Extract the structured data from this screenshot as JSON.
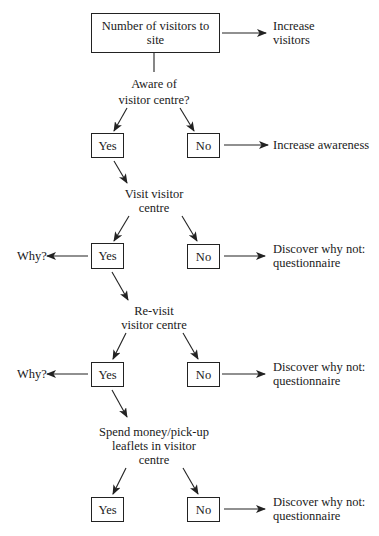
{
  "diagram": {
    "title_node": {
      "line1": "Number of visitors to",
      "line2": "site"
    },
    "top_outcome": {
      "line1": "Increase",
      "line2": "visitors"
    },
    "decisions": [
      {
        "lines": [
          "Aware of",
          "visitor centre?"
        ],
        "yes_label": "Yes",
        "no_label": "No",
        "no_outcome": [
          "Increase awareness"
        ],
        "yes_outcome": null
      },
      {
        "lines": [
          "Visit visitor",
          "centre"
        ],
        "yes_label": "Yes",
        "no_label": "No",
        "no_outcome": [
          "Discover why not:",
          "questionnaire"
        ],
        "yes_outcome": "Why?"
      },
      {
        "lines": [
          "Re-visit",
          "visitor centre"
        ],
        "yes_label": "Yes",
        "no_label": "No",
        "no_outcome": [
          "Discover why not:",
          "questionnaire"
        ],
        "yes_outcome": "Why?"
      },
      {
        "lines": [
          "Spend money/pick-up",
          "leaflets in visitor",
          "centre"
        ],
        "yes_label": "Yes",
        "no_label": "No",
        "no_outcome": [
          "Discover why not:",
          "questionnaire"
        ],
        "yes_outcome": null
      }
    ],
    "colors": {
      "line": "#222222",
      "text": "#1a1a1a",
      "background": "#ffffff"
    }
  }
}
